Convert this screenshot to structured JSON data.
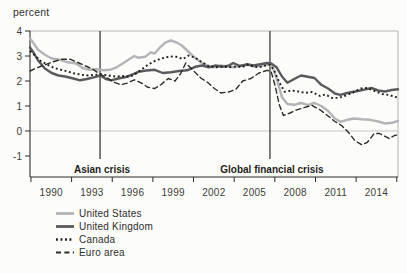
{
  "chart": {
    "unit_label": "percent"
  },
  "colors": {
    "background": "#fcfcfa",
    "axis": "#2b2b28",
    "frame": "#a3a39f",
    "zero_line": "#c6c6c2",
    "crisis_line": "#3a3a37",
    "text": "#33332f",
    "tick_text": "#3c3c38",
    "annotation_text": "#1f1f1c"
  },
  "chart_data": {
    "type": "line",
    "title": "",
    "ylabel": "percent",
    "xlabel": "",
    "xlim": [
      1988.4,
      2015.56
    ],
    "ylim": [
      -1.84,
      4
    ],
    "grid": "horizontal zero-line only",
    "legend_position": "below-left",
    "x_ticks": [
      1988.47,
      1991.47,
      1994.47,
      1997.47,
      2000.47,
      2003.47,
      2006.47,
      2009.47,
      2012.47,
      2015.47
    ],
    "x_labels": [
      {
        "text": "1990",
        "x": 1989.97
      },
      {
        "text": "1993",
        "x": 1992.97
      },
      {
        "text": "1996",
        "x": 1995.97
      },
      {
        "text": "1999",
        "x": 1998.97
      },
      {
        "text": "2002",
        "x": 2001.97
      },
      {
        "text": "2005",
        "x": 2004.97
      },
      {
        "text": "2008",
        "x": 2007.97
      },
      {
        "text": "2011",
        "x": 2010.97
      },
      {
        "text": "2014",
        "x": 2013.97
      }
    ],
    "y_ticks": [
      {
        "text": "4",
        "v": 4
      },
      {
        "text": "3",
        "v": 3
      },
      {
        "text": "2",
        "v": 2
      },
      {
        "text": "1",
        "v": 1
      },
      {
        "text": "0",
        "v": 0
      },
      {
        "text": "-1",
        "v": -1
      }
    ],
    "annotations": [
      {
        "label": "Asian crisis",
        "x": 1993.57
      },
      {
        "label": "Global financial crisis",
        "x": 2006.11
      }
    ],
    "series": [
      {
        "name": "United States",
        "color": "#b3b4b6",
        "style": "solid",
        "width": 2.4,
        "points": [
          [
            1988.4,
            3.7
          ],
          [
            1988.7,
            3.48
          ],
          [
            1989.0,
            3.25
          ],
          [
            1989.5,
            3.05
          ],
          [
            1990.0,
            2.9
          ],
          [
            1990.6,
            2.85
          ],
          [
            1991.2,
            2.75
          ],
          [
            1991.8,
            2.7
          ],
          [
            1992.3,
            2.52
          ],
          [
            1992.8,
            2.45
          ],
          [
            1993.3,
            2.47
          ],
          [
            1993.8,
            2.43
          ],
          [
            1994.3,
            2.45
          ],
          [
            1994.8,
            2.55
          ],
          [
            1995.3,
            2.72
          ],
          [
            1995.8,
            2.9
          ],
          [
            1996.1,
            3.0
          ],
          [
            1996.4,
            2.93
          ],
          [
            1996.9,
            2.97
          ],
          [
            1997.3,
            3.15
          ],
          [
            1997.6,
            3.1
          ],
          [
            1998.0,
            3.35
          ],
          [
            1998.4,
            3.55
          ],
          [
            1998.8,
            3.62
          ],
          [
            1999.2,
            3.55
          ],
          [
            1999.6,
            3.42
          ],
          [
            2000.0,
            3.22
          ],
          [
            2000.5,
            2.97
          ],
          [
            2001.0,
            2.75
          ],
          [
            2001.5,
            2.62
          ],
          [
            2002.0,
            2.55
          ],
          [
            2002.5,
            2.62
          ],
          [
            2003.0,
            2.58
          ],
          [
            2003.5,
            2.55
          ],
          [
            2004.0,
            2.62
          ],
          [
            2004.5,
            2.65
          ],
          [
            2005.0,
            2.58
          ],
          [
            2005.5,
            2.62
          ],
          [
            2006.0,
            2.67
          ],
          [
            2006.3,
            2.58
          ],
          [
            2006.6,
            2.1
          ],
          [
            2007.0,
            1.35
          ],
          [
            2007.4,
            1.08
          ],
          [
            2007.9,
            1.05
          ],
          [
            2008.4,
            1.12
          ],
          [
            2008.9,
            1.05
          ],
          [
            2009.4,
            1.12
          ],
          [
            2009.9,
            1.0
          ],
          [
            2010.4,
            0.8
          ],
          [
            2010.9,
            0.5
          ],
          [
            2011.3,
            0.37
          ],
          [
            2011.8,
            0.45
          ],
          [
            2012.3,
            0.5
          ],
          [
            2012.9,
            0.47
          ],
          [
            2013.5,
            0.45
          ],
          [
            2014.1,
            0.38
          ],
          [
            2014.6,
            0.3
          ],
          [
            2015.1,
            0.33
          ],
          [
            2015.56,
            0.4
          ]
        ]
      },
      {
        "name": "United Kingdom",
        "color": "#595a5c",
        "style": "solid",
        "width": 2.4,
        "points": [
          [
            1988.4,
            3.35
          ],
          [
            1988.7,
            3.1
          ],
          [
            1989.0,
            2.82
          ],
          [
            1989.5,
            2.5
          ],
          [
            1990.0,
            2.32
          ],
          [
            1990.5,
            2.22
          ],
          [
            1991.0,
            2.18
          ],
          [
            1991.6,
            2.1
          ],
          [
            1992.1,
            2.03
          ],
          [
            1992.6,
            2.08
          ],
          [
            1993.1,
            2.15
          ],
          [
            1993.6,
            2.22
          ],
          [
            1994.0,
            2.08
          ],
          [
            1994.4,
            2.03
          ],
          [
            1994.9,
            2.1
          ],
          [
            1995.4,
            2.15
          ],
          [
            1995.9,
            2.25
          ],
          [
            1996.4,
            2.37
          ],
          [
            1997.0,
            2.42
          ],
          [
            1997.6,
            2.45
          ],
          [
            1998.2,
            2.32
          ],
          [
            1998.8,
            2.35
          ],
          [
            1999.4,
            2.4
          ],
          [
            2000.0,
            2.43
          ],
          [
            2000.6,
            2.57
          ],
          [
            2001.1,
            2.62
          ],
          [
            2001.6,
            2.55
          ],
          [
            2002.1,
            2.62
          ],
          [
            2002.6,
            2.57
          ],
          [
            2003.1,
            2.63
          ],
          [
            2003.4,
            2.72
          ],
          [
            2003.9,
            2.6
          ],
          [
            2004.4,
            2.67
          ],
          [
            2004.9,
            2.62
          ],
          [
            2005.4,
            2.67
          ],
          [
            2005.9,
            2.72
          ],
          [
            2006.2,
            2.7
          ],
          [
            2006.6,
            2.55
          ],
          [
            2007.0,
            2.18
          ],
          [
            2007.4,
            1.93
          ],
          [
            2007.9,
            2.08
          ],
          [
            2008.4,
            2.22
          ],
          [
            2008.9,
            2.17
          ],
          [
            2009.4,
            2.12
          ],
          [
            2009.9,
            1.85
          ],
          [
            2010.4,
            1.7
          ],
          [
            2010.9,
            1.5
          ],
          [
            2011.3,
            1.45
          ],
          [
            2011.8,
            1.52
          ],
          [
            2012.4,
            1.58
          ],
          [
            2013.0,
            1.65
          ],
          [
            2013.6,
            1.72
          ],
          [
            2014.1,
            1.62
          ],
          [
            2014.6,
            1.58
          ],
          [
            2015.1,
            1.64
          ],
          [
            2015.56,
            1.67
          ]
        ]
      },
      {
        "name": "Canada",
        "color": "#1e1e1b",
        "style": "dotted",
        "width": 1.9,
        "points": [
          [
            1988.4,
            3.2
          ],
          [
            1988.8,
            3.0
          ],
          [
            1989.2,
            2.8
          ],
          [
            1989.7,
            2.65
          ],
          [
            1990.2,
            2.52
          ],
          [
            1990.7,
            2.45
          ],
          [
            1991.2,
            2.38
          ],
          [
            1991.7,
            2.3
          ],
          [
            1992.2,
            2.25
          ],
          [
            1992.7,
            2.22
          ],
          [
            1993.2,
            2.25
          ],
          [
            1993.7,
            2.27
          ],
          [
            1994.2,
            2.22
          ],
          [
            1994.7,
            2.18
          ],
          [
            1995.2,
            2.2
          ],
          [
            1995.7,
            2.17
          ],
          [
            1996.1,
            2.25
          ],
          [
            1996.6,
            2.45
          ],
          [
            1997.1,
            2.65
          ],
          [
            1997.6,
            2.8
          ],
          [
            1998.1,
            2.9
          ],
          [
            1998.7,
            2.98
          ],
          [
            1999.2,
            2.97
          ],
          [
            1999.7,
            2.88
          ],
          [
            2000.1,
            3.02
          ],
          [
            2000.6,
            2.93
          ],
          [
            2001.1,
            2.75
          ],
          [
            2001.6,
            2.58
          ],
          [
            2002.1,
            2.55
          ],
          [
            2002.6,
            2.58
          ],
          [
            2003.1,
            2.55
          ],
          [
            2003.6,
            2.58
          ],
          [
            2004.1,
            2.56
          ],
          [
            2004.4,
            2.66
          ],
          [
            2004.9,
            2.58
          ],
          [
            2005.3,
            2.55
          ],
          [
            2005.8,
            2.62
          ],
          [
            2006.1,
            2.65
          ],
          [
            2006.4,
            2.45
          ],
          [
            2006.8,
            1.95
          ],
          [
            2007.2,
            1.57
          ],
          [
            2007.7,
            1.62
          ],
          [
            2008.2,
            1.58
          ],
          [
            2008.7,
            1.53
          ],
          [
            2009.2,
            1.56
          ],
          [
            2009.8,
            1.4
          ],
          [
            2010.2,
            1.46
          ],
          [
            2010.7,
            1.32
          ],
          [
            2011.2,
            1.33
          ],
          [
            2011.7,
            1.42
          ],
          [
            2012.2,
            1.53
          ],
          [
            2012.8,
            1.7
          ],
          [
            2013.3,
            1.72
          ],
          [
            2013.9,
            1.58
          ],
          [
            2014.4,
            1.48
          ],
          [
            2014.9,
            1.44
          ],
          [
            2015.56,
            1.33
          ]
        ]
      },
      {
        "name": "Euro area",
        "color": "#2c2c29",
        "style": "dashed",
        "width": 1.4,
        "points": [
          [
            1988.4,
            2.4
          ],
          [
            1988.8,
            2.5
          ],
          [
            1989.4,
            2.63
          ],
          [
            1990.0,
            2.75
          ],
          [
            1990.7,
            2.87
          ],
          [
            1991.4,
            2.87
          ],
          [
            1992.0,
            2.72
          ],
          [
            1992.6,
            2.58
          ],
          [
            1993.1,
            2.45
          ],
          [
            1993.6,
            2.27
          ],
          [
            1994.1,
            2.12
          ],
          [
            1994.6,
            1.95
          ],
          [
            1995.1,
            1.85
          ],
          [
            1995.6,
            1.92
          ],
          [
            1996.1,
            2.05
          ],
          [
            1996.6,
            1.93
          ],
          [
            1997.1,
            1.75
          ],
          [
            1997.6,
            1.7
          ],
          [
            1998.1,
            1.87
          ],
          [
            1998.6,
            2.1
          ],
          [
            1999.1,
            2.0
          ],
          [
            1999.5,
            2.28
          ],
          [
            1999.9,
            2.72
          ],
          [
            2000.4,
            2.45
          ],
          [
            2001.0,
            2.12
          ],
          [
            2001.5,
            1.95
          ],
          [
            2002.0,
            1.7
          ],
          [
            2002.5,
            1.52
          ],
          [
            2003.1,
            1.57
          ],
          [
            2003.6,
            1.67
          ],
          [
            2004.1,
            2.0
          ],
          [
            2004.7,
            2.1
          ],
          [
            2005.3,
            2.32
          ],
          [
            2005.9,
            2.43
          ],
          [
            2006.2,
            2.37
          ],
          [
            2006.5,
            1.8
          ],
          [
            2006.8,
            1.05
          ],
          [
            2007.1,
            0.62
          ],
          [
            2007.6,
            0.72
          ],
          [
            2008.1,
            0.85
          ],
          [
            2008.6,
            0.93
          ],
          [
            2009.2,
            1.03
          ],
          [
            2009.8,
            0.85
          ],
          [
            2010.4,
            0.6
          ],
          [
            2010.9,
            0.38
          ],
          [
            2011.4,
            0.22
          ],
          [
            2011.9,
            -0.05
          ],
          [
            2012.4,
            -0.4
          ],
          [
            2012.9,
            -0.55
          ],
          [
            2013.3,
            -0.45
          ],
          [
            2013.8,
            -0.1
          ],
          [
            2014.2,
            -0.1
          ],
          [
            2014.9,
            -0.3
          ],
          [
            2015.3,
            -0.18
          ],
          [
            2015.56,
            -0.15
          ]
        ]
      }
    ]
  }
}
